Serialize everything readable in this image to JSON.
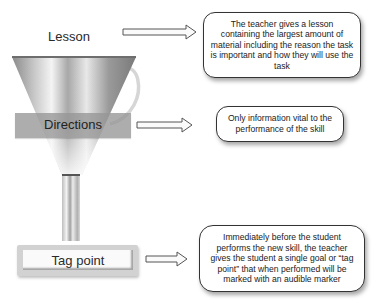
{
  "diagram": {
    "type": "funnel-process",
    "stages": [
      {
        "id": "lesson",
        "label": "Lesson",
        "description": "The teacher gives a lesson containing the largest amount of material including the reason the task is important and how they will use the task"
      },
      {
        "id": "directions",
        "label": "Directions",
        "description": "Only information vital to the performance of the skill"
      },
      {
        "id": "tag-point",
        "label": "Tag point",
        "description": "Immediately before the student performs the new skill, the teacher gives the student a single goal or “tag point” that when performed will be marked with an audible marker"
      }
    ],
    "icons": {
      "funnel": "funnel-icon",
      "arrow": "right-arrow-icon"
    },
    "colors": {
      "band": "#969696",
      "tag_frame": "#d2d2d2",
      "callout_border": "#333333"
    }
  }
}
